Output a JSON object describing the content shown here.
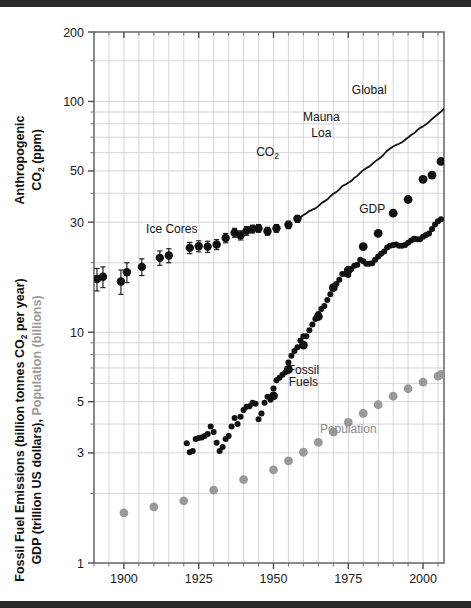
{
  "figure": {
    "background": "#ffffff",
    "band_color": "#2b2b2b",
    "plot": {
      "left": 94,
      "right": 444,
      "top": 32,
      "bottom": 563
    }
  },
  "axes": {
    "y_left_title_top": "Anthropogenic",
    "y_left_title_top2": "CO",
    "y_left_title_top2_sub": "2",
    "y_left_title_top2_tail": " (ppm)",
    "y_left_title_bottom_a": "Fossil Fuel Emissions (billion tonnes CO",
    "y_left_title_bottom_a_sub": "2",
    "y_left_title_bottom_a_tail": " per year)",
    "y_left_title_bottom_b": "GDP (trillion US dollars), ",
    "y_left_title_bottom_b_gray": "Population (billions)",
    "y_ticks": [
      200,
      100,
      50,
      30,
      10,
      5,
      3,
      1
    ],
    "y_tick_labels": [
      "200",
      "100",
      "50",
      "30",
      "10",
      "5",
      "3",
      "1"
    ],
    "y_minor": [
      150,
      90,
      80,
      70,
      60,
      40,
      20,
      9,
      8,
      7,
      6,
      4,
      2
    ],
    "x_ticks": [
      1900,
      1925,
      1950,
      1975,
      2000
    ],
    "x_tick_labels": [
      "1900",
      "1925",
      "1950",
      "1975",
      "2000"
    ],
    "x_minor_step": 5,
    "xlim": [
      1890,
      2007
    ],
    "ylim": [
      1,
      200
    ],
    "yscale": "log",
    "grid": true,
    "grid_color": "#c9ccd4"
  },
  "annotations": [
    {
      "name": "ice-cores-label",
      "text": "Ice Cores",
      "x": 1916,
      "y": 27.0,
      "color": "#111111"
    },
    {
      "name": "co2-label",
      "text": "CO",
      "sub": "2",
      "x": 1948,
      "y": 58.0,
      "color": "#111111"
    },
    {
      "name": "mauna-loa-label-1",
      "text": "Mauna",
      "x": 1966,
      "y": 82.0,
      "color": "#111111"
    },
    {
      "name": "mauna-loa-label-2",
      "text": "Loa",
      "x": 1966,
      "y": 70.0,
      "color": "#111111"
    },
    {
      "name": "global-label",
      "text": "Global",
      "x": 1982,
      "y": 108.0,
      "color": "#111111"
    },
    {
      "name": "gdp-label",
      "text": "GDP",
      "x": 1983,
      "y": 33.0,
      "color": "#111111"
    },
    {
      "name": "fossil-fuels-label-1",
      "text": "Fossil",
      "x": 1960,
      "y": 6.6,
      "color": "#111111"
    },
    {
      "name": "fossil-fuels-label-2",
      "text": "Fuels",
      "x": 1960,
      "y": 5.85,
      "color": "#111111"
    },
    {
      "name": "population-label",
      "text": "Population",
      "x": 1975,
      "y": 3.65,
      "color": "#8a8a8a"
    }
  ],
  "chart_data": {
    "type": "scatter",
    "title": "",
    "xlabel": "",
    "ylabel": "Anthropogenic CO2 (ppm) / Fossil Fuel Emissions (billion tonnes CO2 per year), GDP (trillion US dollars), Population (billions)",
    "xlim": [
      1890,
      2007
    ],
    "ylim": [
      1,
      200
    ],
    "yscale": "log",
    "grid": true,
    "legend": "inline annotations",
    "series": [
      {
        "name": "Ice Cores",
        "marker": "circle-errorbar",
        "color": "#111111",
        "size": 4.2,
        "points": [
          {
            "x": 1891,
            "y": 17.0,
            "err": 1.9
          },
          {
            "x": 1893,
            "y": 17.4,
            "err": 1.8
          },
          {
            "x": 1899,
            "y": 16.6,
            "err": 2.0
          },
          {
            "x": 1901,
            "y": 18.2,
            "err": 1.8
          },
          {
            "x": 1906,
            "y": 19.2,
            "err": 1.6
          },
          {
            "x": 1912,
            "y": 21.0,
            "err": 1.5
          },
          {
            "x": 1915,
            "y": 21.5,
            "err": 1.5
          },
          {
            "x": 1922,
            "y": 23.2,
            "err": 1.3
          },
          {
            "x": 1925,
            "y": 23.6,
            "err": 1.3
          },
          {
            "x": 1928,
            "y": 23.5,
            "err": 1.3
          },
          {
            "x": 1931,
            "y": 24.0,
            "err": 1.2
          },
          {
            "x": 1934,
            "y": 25.6,
            "err": 1.2
          },
          {
            "x": 1937,
            "y": 27.0,
            "err": 1.2
          },
          {
            "x": 1939,
            "y": 26.3,
            "err": 1.2
          },
          {
            "x": 1941,
            "y": 27.5,
            "err": 1.2
          },
          {
            "x": 1943,
            "y": 28.0,
            "err": 1.1
          },
          {
            "x": 1945,
            "y": 28.2,
            "err": 1.1
          },
          {
            "x": 1948,
            "y": 27.4,
            "err": 1.1
          },
          {
            "x": 1951,
            "y": 28.2,
            "err": 1.1
          },
          {
            "x": 1955,
            "y": 29.2,
            "err": 1.1
          },
          {
            "x": 1958,
            "y": 31.0,
            "err": 1.1
          }
        ]
      },
      {
        "name": "CO2 Mauna Loa / Global",
        "marker": "line",
        "color": "#111111",
        "width": 1.8,
        "points": [
          {
            "x": 1959,
            "y": 31.5
          },
          {
            "x": 1960,
            "y": 32.2
          },
          {
            "x": 1961,
            "y": 32.8
          },
          {
            "x": 1962,
            "y": 33.5
          },
          {
            "x": 1963,
            "y": 34.0
          },
          {
            "x": 1964,
            "y": 34.4
          },
          {
            "x": 1965,
            "y": 35.2
          },
          {
            "x": 1966,
            "y": 36.2
          },
          {
            "x": 1967,
            "y": 36.9
          },
          {
            "x": 1968,
            "y": 37.6
          },
          {
            "x": 1969,
            "y": 38.8
          },
          {
            "x": 1970,
            "y": 39.8
          },
          {
            "x": 1971,
            "y": 40.5
          },
          {
            "x": 1972,
            "y": 41.6
          },
          {
            "x": 1973,
            "y": 43.0
          },
          {
            "x": 1974,
            "y": 43.6
          },
          {
            "x": 1975,
            "y": 44.4
          },
          {
            "x": 1976,
            "y": 45.2
          },
          {
            "x": 1977,
            "y": 46.6
          },
          {
            "x": 1978,
            "y": 47.6
          },
          {
            "x": 1979,
            "y": 49.0
          },
          {
            "x": 1980,
            "y": 50.4
          },
          {
            "x": 1981,
            "y": 51.4
          },
          {
            "x": 1982,
            "y": 52.2
          },
          {
            "x": 1983,
            "y": 53.6
          },
          {
            "x": 1984,
            "y": 55.0
          },
          {
            "x": 1985,
            "y": 56.2
          },
          {
            "x": 1986,
            "y": 57.4
          },
          {
            "x": 1987,
            "y": 59.2
          },
          {
            "x": 1988,
            "y": 61.2
          },
          {
            "x": 1989,
            "y": 62.6
          },
          {
            "x": 1990,
            "y": 63.8
          },
          {
            "x": 1991,
            "y": 64.8
          },
          {
            "x": 1992,
            "y": 65.6
          },
          {
            "x": 1993,
            "y": 66.6
          },
          {
            "x": 1994,
            "y": 68.2
          },
          {
            "x": 1995,
            "y": 69.8
          },
          {
            "x": 1996,
            "y": 71.6
          },
          {
            "x": 1997,
            "y": 72.8
          },
          {
            "x": 1998,
            "y": 75.0
          },
          {
            "x": 1999,
            "y": 76.8
          },
          {
            "x": 2000,
            "y": 78.0
          },
          {
            "x": 2001,
            "y": 79.6
          },
          {
            "x": 2002,
            "y": 81.6
          },
          {
            "x": 2003,
            "y": 84.0
          },
          {
            "x": 2004,
            "y": 86.0
          },
          {
            "x": 2005,
            "y": 88.2
          },
          {
            "x": 2006,
            "y": 90.4
          },
          {
            "x": 2007,
            "y": 92.8
          }
        ]
      },
      {
        "name": "Fossil Fuels",
        "marker": "circle",
        "color": "#111111",
        "size": 3.0,
        "points": [
          {
            "x": 1921,
            "y": 3.3
          },
          {
            "x": 1922,
            "y": 3.02
          },
          {
            "x": 1923,
            "y": 3.06
          },
          {
            "x": 1924,
            "y": 3.45
          },
          {
            "x": 1925,
            "y": 3.48
          },
          {
            "x": 1926,
            "y": 3.5
          },
          {
            "x": 1927,
            "y": 3.55
          },
          {
            "x": 1928,
            "y": 3.62
          },
          {
            "x": 1929,
            "y": 3.9
          },
          {
            "x": 1930,
            "y": 3.7
          },
          {
            "x": 1931,
            "y": 3.32
          },
          {
            "x": 1932,
            "y": 3.06
          },
          {
            "x": 1933,
            "y": 3.18
          },
          {
            "x": 1934,
            "y": 3.45
          },
          {
            "x": 1935,
            "y": 3.55
          },
          {
            "x": 1936,
            "y": 3.9
          },
          {
            "x": 1937,
            "y": 4.25
          },
          {
            "x": 1938,
            "y": 4.0
          },
          {
            "x": 1939,
            "y": 4.3
          },
          {
            "x": 1940,
            "y": 4.6
          },
          {
            "x": 1941,
            "y": 4.75
          },
          {
            "x": 1942,
            "y": 4.78
          },
          {
            "x": 1943,
            "y": 4.95
          },
          {
            "x": 1944,
            "y": 4.9
          },
          {
            "x": 1945,
            "y": 4.2
          },
          {
            "x": 1946,
            "y": 4.45
          },
          {
            "x": 1947,
            "y": 4.95
          },
          {
            "x": 1948,
            "y": 5.25
          },
          {
            "x": 1949,
            "y": 5.1
          },
          {
            "x": 1950,
            "y": 5.7
          },
          {
            "x": 1951,
            "y": 6.2
          },
          {
            "x": 1952,
            "y": 6.35
          },
          {
            "x": 1953,
            "y": 6.55
          },
          {
            "x": 1954,
            "y": 6.7
          },
          {
            "x": 1955,
            "y": 7.4
          },
          {
            "x": 1956,
            "y": 7.9
          },
          {
            "x": 1957,
            "y": 8.3
          },
          {
            "x": 1958,
            "y": 8.6
          },
          {
            "x": 1959,
            "y": 9.2
          },
          {
            "x": 1960,
            "y": 9.6
          },
          {
            "x": 1961,
            "y": 9.6
          },
          {
            "x": 1962,
            "y": 10.2
          },
          {
            "x": 1963,
            "y": 10.8
          },
          {
            "x": 1964,
            "y": 11.4
          },
          {
            "x": 1965,
            "y": 12.0
          },
          {
            "x": 1966,
            "y": 12.6
          },
          {
            "x": 1967,
            "y": 13.0
          },
          {
            "x": 1968,
            "y": 13.8
          },
          {
            "x": 1969,
            "y": 14.6
          },
          {
            "x": 1970,
            "y": 15.6
          },
          {
            "x": 1971,
            "y": 16.2
          },
          {
            "x": 1972,
            "y": 16.9
          },
          {
            "x": 1973,
            "y": 17.9
          },
          {
            "x": 1974,
            "y": 17.9
          },
          {
            "x": 1975,
            "y": 17.7
          },
          {
            "x": 1976,
            "y": 18.8
          },
          {
            "x": 1977,
            "y": 19.4
          },
          {
            "x": 1978,
            "y": 19.6
          },
          {
            "x": 1979,
            "y": 20.6
          },
          {
            "x": 1980,
            "y": 20.3
          },
          {
            "x": 1981,
            "y": 19.8
          },
          {
            "x": 1982,
            "y": 19.8
          },
          {
            "x": 1983,
            "y": 19.9
          },
          {
            "x": 1984,
            "y": 20.6
          },
          {
            "x": 1985,
            "y": 21.3
          },
          {
            "x": 1986,
            "y": 21.9
          },
          {
            "x": 1987,
            "y": 22.4
          },
          {
            "x": 1988,
            "y": 23.3
          },
          {
            "x": 1989,
            "y": 23.7
          },
          {
            "x": 1990,
            "y": 23.9
          },
          {
            "x": 1991,
            "y": 24.0
          },
          {
            "x": 1992,
            "y": 23.7
          },
          {
            "x": 1993,
            "y": 23.7
          },
          {
            "x": 1994,
            "y": 23.9
          },
          {
            "x": 1995,
            "y": 24.4
          },
          {
            "x": 1996,
            "y": 25.0
          },
          {
            "x": 1997,
            "y": 25.4
          },
          {
            "x": 1998,
            "y": 25.3
          },
          {
            "x": 1999,
            "y": 25.3
          },
          {
            "x": 2000,
            "y": 25.9
          },
          {
            "x": 2001,
            "y": 26.4
          },
          {
            "x": 2002,
            "y": 26.8
          },
          {
            "x": 2003,
            "y": 28.0
          },
          {
            "x": 2004,
            "y": 29.3
          },
          {
            "x": 2005,
            "y": 30.3
          },
          {
            "x": 2006,
            "y": 30.9
          }
        ]
      },
      {
        "name": "GDP",
        "marker": "circle",
        "color": "#111111",
        "size": 4.4,
        "points": [
          {
            "x": 1950,
            "y": 5.3
          },
          {
            "x": 1955,
            "y": 6.9
          },
          {
            "x": 1960,
            "y": 8.8
          },
          {
            "x": 1965,
            "y": 11.7
          },
          {
            "x": 1970,
            "y": 15.6
          },
          {
            "x": 1975,
            "y": 18.6
          },
          {
            "x": 1980,
            "y": 23.5
          },
          {
            "x": 1985,
            "y": 26.8
          },
          {
            "x": 1990,
            "y": 32.8
          },
          {
            "x": 1995,
            "y": 37.6
          },
          {
            "x": 2000,
            "y": 46.0
          },
          {
            "x": 2003,
            "y": 48.0
          },
          {
            "x": 2006,
            "y": 55.0
          }
        ]
      },
      {
        "name": "Population",
        "marker": "circle",
        "color": "#999999",
        "size": 4.4,
        "points": [
          {
            "x": 1900,
            "y": 1.65
          },
          {
            "x": 1910,
            "y": 1.75
          },
          {
            "x": 1920,
            "y": 1.86
          },
          {
            "x": 1930,
            "y": 2.07
          },
          {
            "x": 1940,
            "y": 2.3
          },
          {
            "x": 1950,
            "y": 2.53
          },
          {
            "x": 1955,
            "y": 2.77
          },
          {
            "x": 1960,
            "y": 3.02
          },
          {
            "x": 1965,
            "y": 3.33
          },
          {
            "x": 1970,
            "y": 3.7
          },
          {
            "x": 1975,
            "y": 4.07
          },
          {
            "x": 1980,
            "y": 4.45
          },
          {
            "x": 1985,
            "y": 4.85
          },
          {
            "x": 1990,
            "y": 5.28
          },
          {
            "x": 1995,
            "y": 5.69
          },
          {
            "x": 2000,
            "y": 6.08
          },
          {
            "x": 2005,
            "y": 6.46
          },
          {
            "x": 2006,
            "y": 6.56
          }
        ]
      }
    ]
  }
}
